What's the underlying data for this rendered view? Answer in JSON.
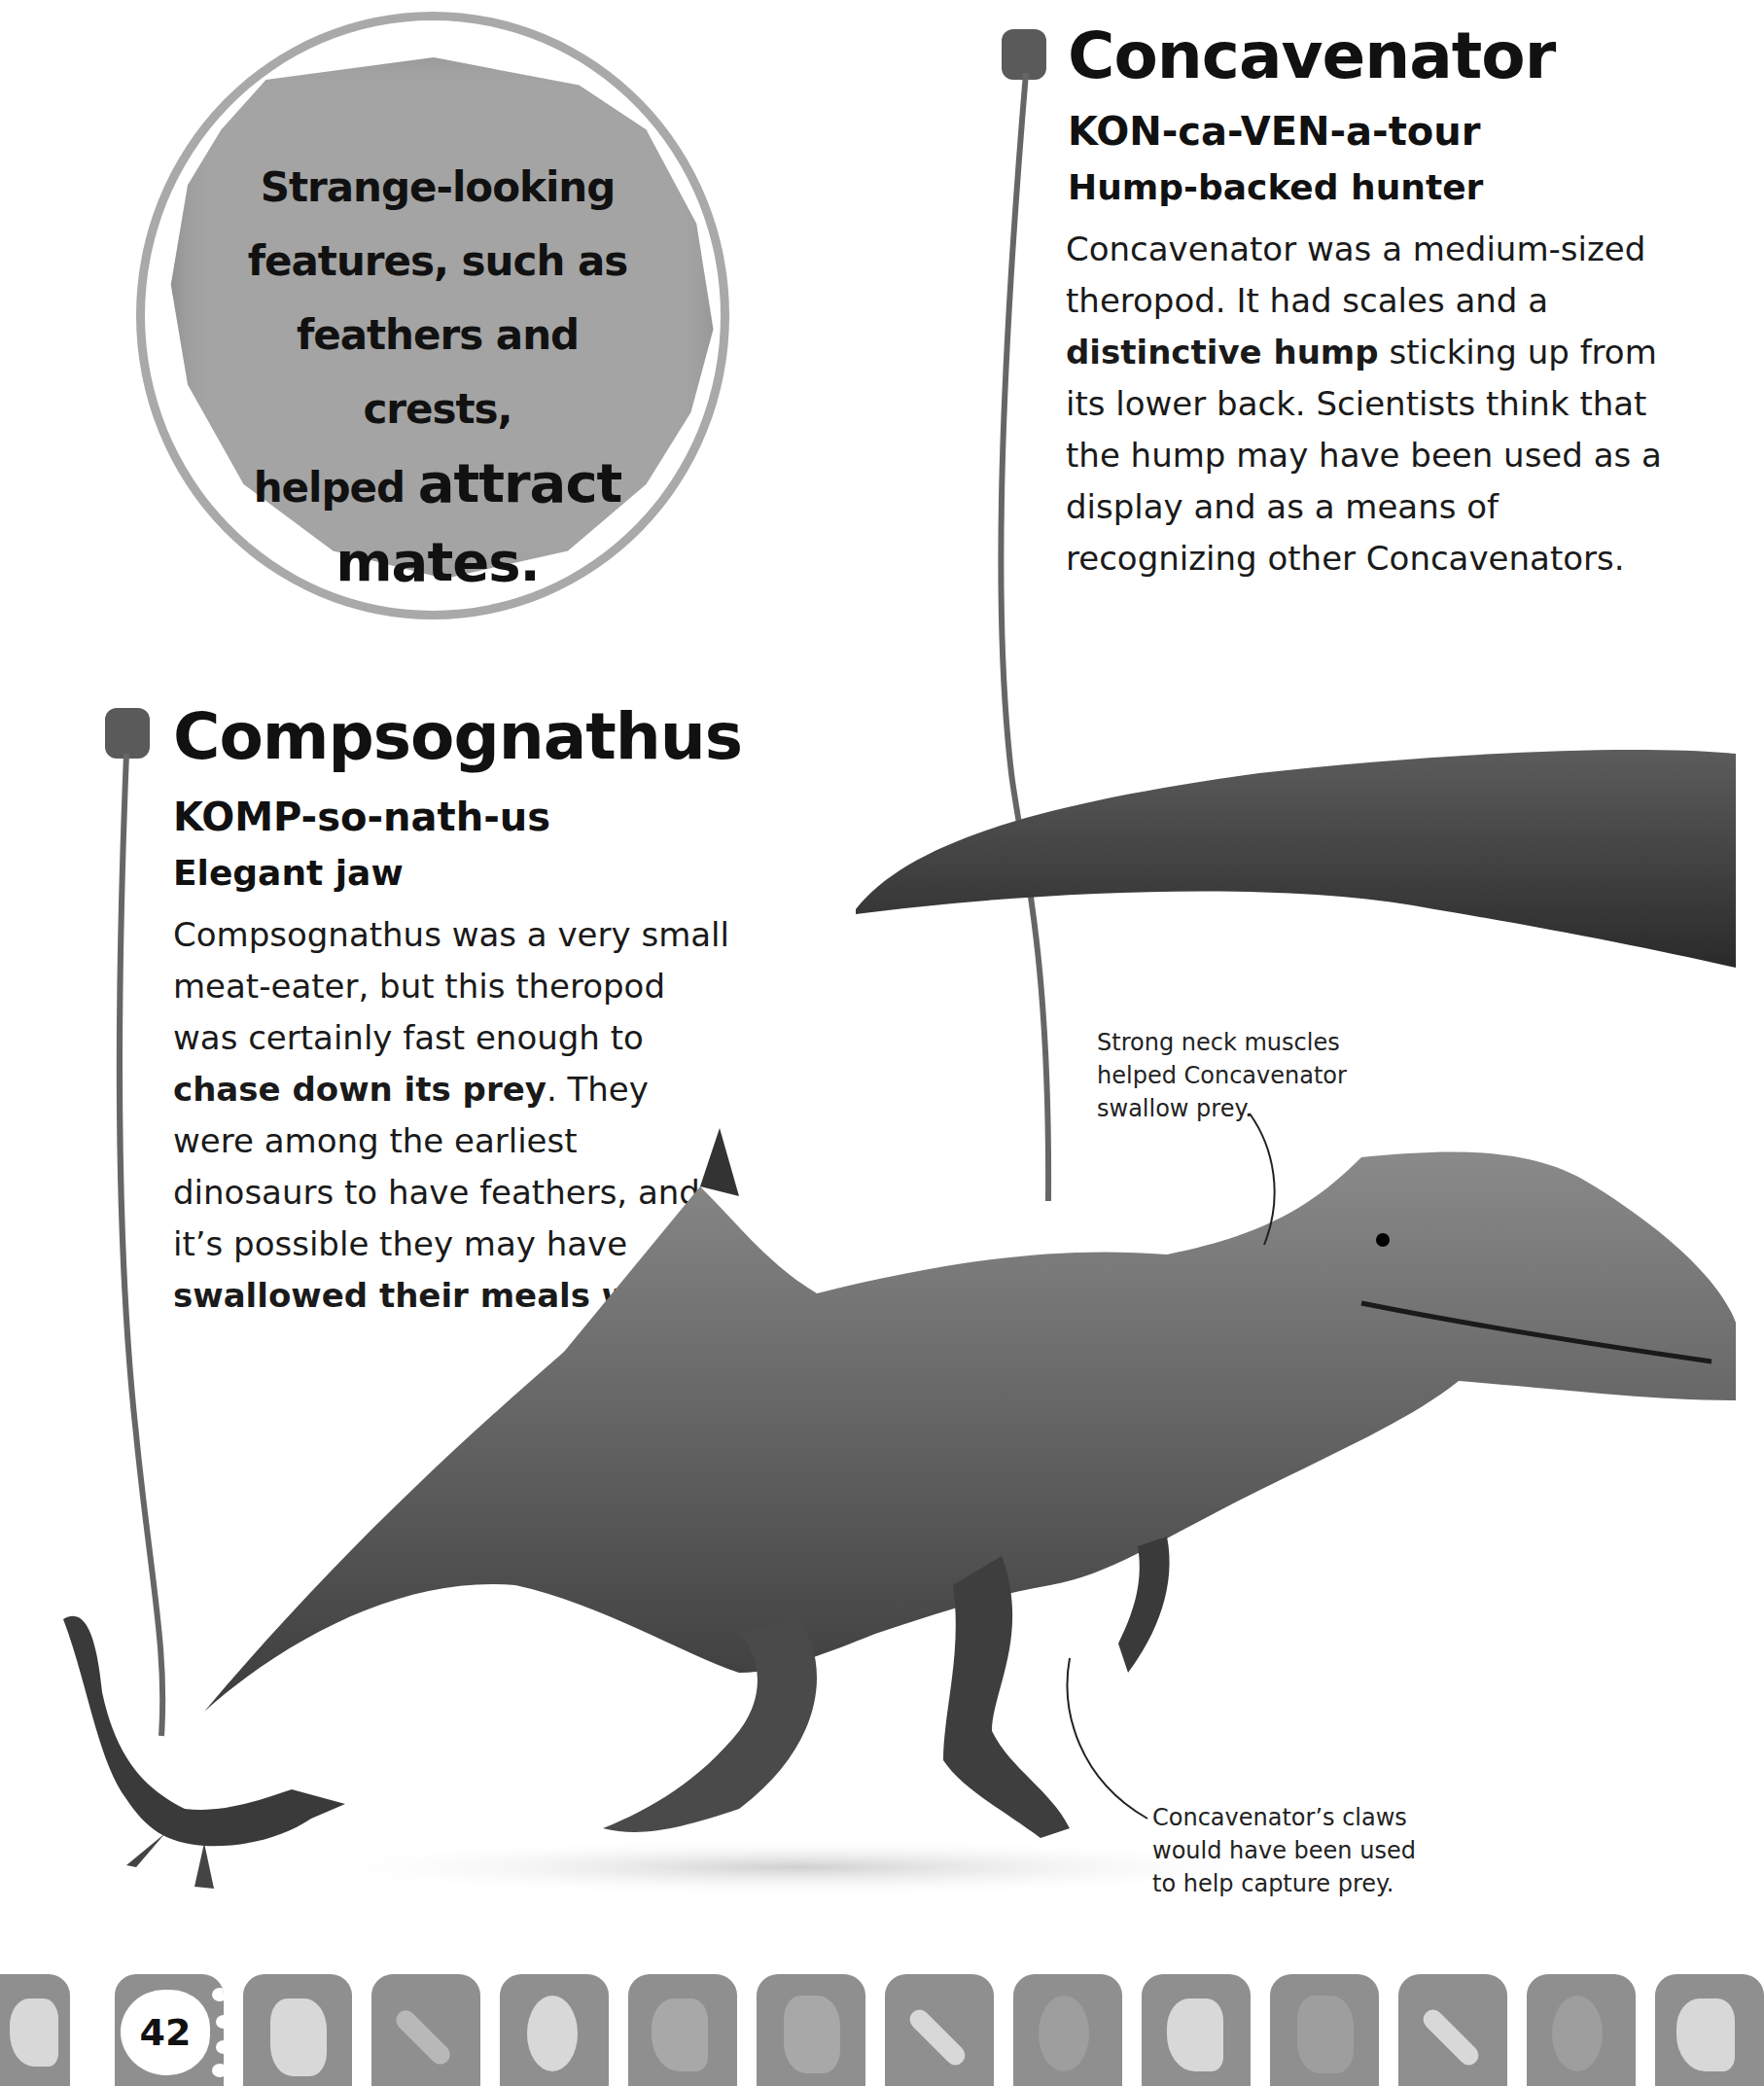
{
  "callout": {
    "lines": [
      "Strange-looking",
      "features, such as",
      "feathers and crests,"
    ],
    "line4_prefix": "helped ",
    "line4_emphasis": "attract",
    "line5": "mates."
  },
  "concavenator": {
    "title": "Concavenator",
    "pronunciation": "KON-ca-VEN-a-tour",
    "meaning": "Hump-backed hunter",
    "body": {
      "p1": "Concavenator was a medium-sized theropod. It had scales and a ",
      "bold1": "distinctive hump",
      "p2": " sticking up from its lower back. Scientists think that the hump may have been used as a display and as a means of recognizing other Concavenators."
    }
  },
  "compsognathus": {
    "title": "Compsognathus",
    "pronunciation": "KOMP-so-nath-us",
    "meaning": "Elegant jaw",
    "body": {
      "p1": "Compsognathus was a very small meat-eater, but this theropod was certainly fast enough to ",
      "bold1": "chase down its prey",
      "p2": ". They were among the earliest dinosaurs to have feathers, and it’s possible they may have ",
      "bold2": "swallowed their meals whole",
      "p3": "."
    }
  },
  "captions": {
    "neck": "Strong neck muscles helped Concavenator swallow prey.",
    "claws": "Concavenator’s claws would have been used to help capture prey."
  },
  "footer": {
    "page_number": "42",
    "tiles": [
      "footprint-1",
      "page-number",
      "footprint-3",
      "footprint-4",
      "footprint-5",
      "footprint-6",
      "footprint-7",
      "footprint-8",
      "footprint-9",
      "footprint-10",
      "footprint-11",
      "footprint-12",
      "footprint-13",
      "footprint-14"
    ]
  },
  "colors": {
    "marker": "#5a5a5a",
    "bubble": "#a4a4a4",
    "footer_tile": "#8f8f8f"
  }
}
